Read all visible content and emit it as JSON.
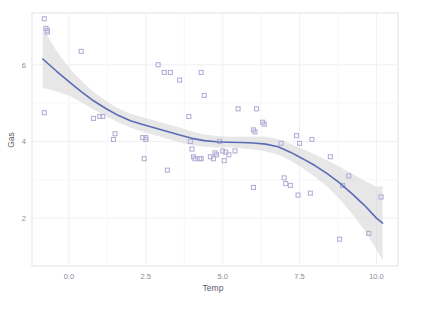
{
  "chart_data": {
    "type": "scatter",
    "title": "",
    "subtitle": "",
    "xlabel": "Temp",
    "ylabel": "Gas",
    "xlim": [
      -1.2,
      10.7
    ],
    "ylim": [
      0.75,
      7.35
    ],
    "xticks": [
      0.0,
      2.5,
      5.0,
      7.5,
      10.0
    ],
    "xtick_labels": [
      "0.0",
      "2.5",
      "5.0",
      "7.5",
      "10.0"
    ],
    "yticks": [
      2,
      4,
      6
    ],
    "ytick_labels": [
      "2",
      "4",
      "6"
    ],
    "grid": true,
    "legend": "none",
    "point_color": "#b3b0d6",
    "line_color": "#5b6bb5",
    "band_color": "#d9d9d9",
    "panel_background": "#ffffff",
    "panel_border_color": "#e2e2e6",
    "grid_color": "#f0f0f4",
    "series": [
      {
        "name": "observations",
        "marker": "square",
        "points": [
          [
            -0.8,
            7.2
          ],
          [
            -0.7,
            6.9
          ],
          [
            -0.7,
            6.85
          ],
          [
            -0.75,
            6.95
          ],
          [
            0.4,
            6.35
          ],
          [
            -0.8,
            4.75
          ],
          [
            0.8,
            4.6
          ],
          [
            1.0,
            4.65
          ],
          [
            1.1,
            4.65
          ],
          [
            1.5,
            4.2
          ],
          [
            1.45,
            4.05
          ],
          [
            2.4,
            4.1
          ],
          [
            2.5,
            4.05
          ],
          [
            2.45,
            3.55
          ],
          [
            2.5,
            4.1
          ],
          [
            2.9,
            6.0
          ],
          [
            3.1,
            5.8
          ],
          [
            3.3,
            5.8
          ],
          [
            3.2,
            3.25
          ],
          [
            3.6,
            5.6
          ],
          [
            3.9,
            4.65
          ],
          [
            3.95,
            4.0
          ],
          [
            4.0,
            3.8
          ],
          [
            4.05,
            3.6
          ],
          [
            4.1,
            3.55
          ],
          [
            4.25,
            3.55
          ],
          [
            4.3,
            3.55
          ],
          [
            4.3,
            5.8
          ],
          [
            4.4,
            5.2
          ],
          [
            4.6,
            3.6
          ],
          [
            4.7,
            3.55
          ],
          [
            4.75,
            3.7
          ],
          [
            4.8,
            3.65
          ],
          [
            4.9,
            4.0
          ],
          [
            5.0,
            3.75
          ],
          [
            5.05,
            3.5
          ],
          [
            5.1,
            3.72
          ],
          [
            5.2,
            3.65
          ],
          [
            5.4,
            3.75
          ],
          [
            5.5,
            4.85
          ],
          [
            6.0,
            4.3
          ],
          [
            6.05,
            4.25
          ],
          [
            6.1,
            4.85
          ],
          [
            6.3,
            4.5
          ],
          [
            6.35,
            4.45
          ],
          [
            6.0,
            2.8
          ],
          [
            6.9,
            3.95
          ],
          [
            7.0,
            3.05
          ],
          [
            7.05,
            2.9
          ],
          [
            7.2,
            2.85
          ],
          [
            7.4,
            4.15
          ],
          [
            7.5,
            3.95
          ],
          [
            7.45,
            2.6
          ],
          [
            7.9,
            4.05
          ],
          [
            7.85,
            2.65
          ],
          [
            8.5,
            3.6
          ],
          [
            8.8,
            1.45
          ],
          [
            9.1,
            3.1
          ],
          [
            8.9,
            2.85
          ],
          [
            9.75,
            1.6
          ],
          [
            10.15,
            2.55
          ]
        ]
      }
    ],
    "smooth": {
      "name": "loess",
      "x": [
        -0.85,
        -0.4,
        0.0,
        0.4,
        0.8,
        1.2,
        1.6,
        2.0,
        2.4,
        2.8,
        3.2,
        3.6,
        4.0,
        4.4,
        4.8,
        5.2,
        5.6,
        6.0,
        6.4,
        6.8,
        7.2,
        7.6,
        8.0,
        8.4,
        8.8,
        9.2,
        9.6,
        10.0,
        10.2
      ],
      "y": [
        6.15,
        5.83,
        5.56,
        5.3,
        5.06,
        4.86,
        4.68,
        4.54,
        4.44,
        4.35,
        4.26,
        4.17,
        4.08,
        4.02,
        3.99,
        3.98,
        3.97,
        3.96,
        3.93,
        3.86,
        3.72,
        3.55,
        3.37,
        3.16,
        2.92,
        2.64,
        2.34,
        2.0,
        1.87
      ],
      "lower": [
        5.4,
        5.3,
        5.2,
        5.02,
        4.83,
        4.66,
        4.5,
        4.36,
        4.25,
        4.16,
        4.07,
        3.98,
        3.9,
        3.86,
        3.84,
        3.84,
        3.82,
        3.79,
        3.74,
        3.66,
        3.5,
        3.3,
        3.08,
        2.82,
        2.5,
        2.12,
        1.7,
        1.18,
        0.9
      ],
      "upper": [
        6.95,
        6.36,
        5.92,
        5.58,
        5.29,
        5.06,
        4.86,
        4.72,
        4.63,
        4.54,
        4.45,
        4.36,
        4.26,
        4.18,
        4.14,
        4.12,
        4.12,
        4.13,
        4.12,
        4.06,
        3.94,
        3.8,
        3.66,
        3.5,
        3.34,
        3.16,
        2.98,
        2.82,
        2.84
      ]
    }
  }
}
